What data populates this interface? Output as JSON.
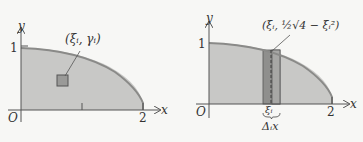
{
  "figures": [
    {
      "id": "left",
      "axis_x_label": "x",
      "axis_y_label": "y",
      "origin_label": "O",
      "tick_y": "1",
      "tick_x": "2",
      "point_label": "(ξᵢ, γᵢ)"
    },
    {
      "id": "right",
      "axis_x_label": "x",
      "axis_y_label": "y",
      "origin_label": "O",
      "tick_y": "1",
      "tick_x": "2",
      "point_label": "(ξᵢ, ½√4 − ξᵢ²)",
      "xi_label": "ξᵢ",
      "dx_label": "Δᵢx"
    }
  ],
  "colors": {
    "region_fill": "#c8c8c6",
    "curve": "#8a8a88",
    "strip_fill": "#8f8f8d",
    "axis": "#555555",
    "background": "#f7f7f5"
  }
}
